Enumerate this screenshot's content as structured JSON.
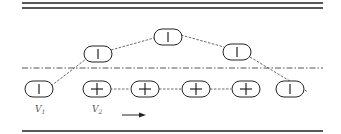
{
  "diagram": {
    "colors": {
      "stroke": "#222222",
      "dashed": "#444444",
      "label": "#555555",
      "background": "#ffffff"
    },
    "boundaries": {
      "top": "double-line",
      "bottom": "single-line",
      "centerline": "dash-dot"
    },
    "lower_row": [
      {
        "id": "v1",
        "symbol": "|",
        "sign": "minus-vertical",
        "x": 38
      },
      {
        "id": "v2",
        "symbol": "+",
        "sign": "plus",
        "x": 97
      },
      {
        "id": "p3",
        "symbol": "+",
        "sign": "plus",
        "x": 145
      },
      {
        "id": "p4",
        "symbol": "+",
        "sign": "plus",
        "x": 196
      },
      {
        "id": "p5",
        "symbol": "+",
        "sign": "plus",
        "x": 246
      },
      {
        "id": "p6",
        "symbol": "|",
        "sign": "minus-vertical",
        "x": 290
      }
    ],
    "upper_arc": [
      {
        "id": "a1",
        "symbol": "|",
        "x": 98,
        "y": 54
      },
      {
        "id": "a2",
        "symbol": "|",
        "x": 167,
        "y": 37
      },
      {
        "id": "a3",
        "symbol": "|",
        "x": 237,
        "y": 52
      }
    ],
    "labels": {
      "v1": {
        "main": "V",
        "sub": "1"
      },
      "v2": {
        "main": "V",
        "sub": "2"
      }
    },
    "arrow": {
      "direction": "right"
    }
  }
}
